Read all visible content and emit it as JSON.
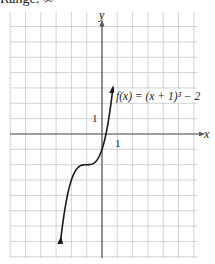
{
  "header": {
    "cropped_text": "Range: ∞"
  },
  "chart_data": {
    "type": "line",
    "title": "",
    "function_label": "f(x) = (x + 1)³ − 2",
    "xlabel": "x",
    "ylabel": "y",
    "tick_labels": {
      "x": "1",
      "y": "1"
    },
    "xlim": [
      -6,
      6
    ],
    "ylim": [
      -8,
      7
    ],
    "grid": true,
    "series": [
      {
        "name": "f(x) = (x + 1)^3 - 2",
        "x": [
          -2.7,
          -2.5,
          -2.25,
          -2,
          -1.75,
          -1.5,
          -1.25,
          -1,
          -0.75,
          -0.5,
          -0.25,
          0,
          0.25,
          0.5,
          0.7
        ],
        "values": [
          -6.91,
          -5.38,
          -3.95,
          -3,
          -2.42,
          -2.13,
          -2.02,
          -2,
          -1.98,
          -1.88,
          -1.58,
          -1,
          -0.05,
          1.38,
          2.91
        ],
        "arrows": "both ends"
      }
    ],
    "key_points": [
      {
        "x": -1,
        "y": -2,
        "note": "inflection point"
      }
    ]
  },
  "colors": {
    "grid": "#c8c8c8",
    "axis": "#555555",
    "curve": "#1a1a1a"
  }
}
